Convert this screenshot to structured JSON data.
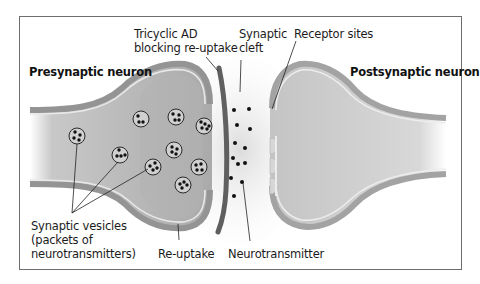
{
  "diagram": {
    "title_left": "Presynaptic neuron",
    "title_right": "Postsynaptic neuron",
    "labels": {
      "tricyclic_line1": "Tricyclic AD",
      "tricyclic_line2": "blocking re-uptake",
      "cleft_line1": "Synaptic",
      "cleft_line2": "cleft",
      "receptor": "Receptor sites",
      "vesicles_line1": "Synaptic vesicles",
      "vesicles_line2": "(packets of",
      "vesicles_line3": "neurotransmitters)",
      "reuptake": "Re-uptake",
      "neurotransmitter": "Neurotransmitter"
    },
    "colors": {
      "neuron_fill": "#b9b9b9",
      "neuron_membrane": "#8f8f8f",
      "membrane_highlight": "#e6e6e6",
      "blocker_bar": "#5f5f5f",
      "vesicle_fill": "#d2d2d2",
      "dot": "#111111",
      "frame": "#6e6e6e"
    },
    "vesicle_count": 10,
    "neurotransmitter_dot_count": 13,
    "receptor_site_count": 3
  }
}
